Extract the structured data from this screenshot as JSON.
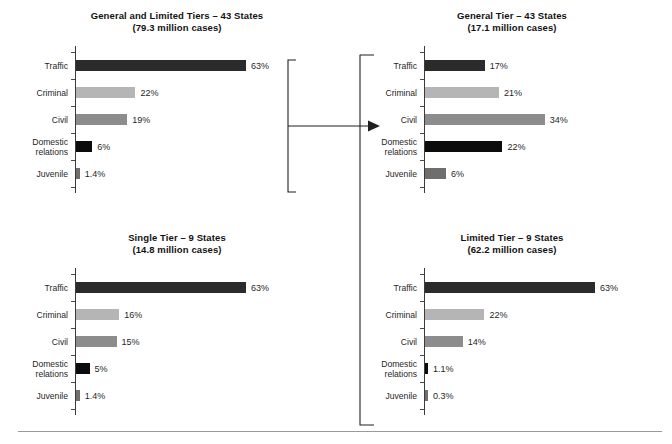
{
  "figure": {
    "background": "#ffffff",
    "rule_color": "#9a9a9a"
  },
  "palette": {
    "traffic": "#2b2b2b",
    "criminal": "#b5b5b5",
    "civil": "#8c8c8c",
    "domestic": "#0c0c0c",
    "juvenile": "#6e6e6e"
  },
  "categories": [
    "Traffic",
    "Criminal",
    "Civil",
    "Domestic\nrelations",
    "Juvenile"
  ],
  "connector": {
    "arrow_name": "flow-arrow-right",
    "left_bracket_name": "left-chart-close-bracket",
    "right_bracket_name": "right-charts-open-bracket"
  },
  "chart_data": [
    {
      "id": "general-and-limited",
      "type": "bar",
      "orientation": "horizontal",
      "title": "General and Limited Tiers – 43 States",
      "subtitle": "(79.3 million cases)",
      "categories": [
        "Traffic",
        "Criminal",
        "Civil",
        "Domestic relations",
        "Juvenile"
      ],
      "values": [
        63,
        22,
        19,
        6,
        1.4
      ],
      "labels": [
        "63%",
        "22%",
        "19%",
        "6%",
        "1.4%"
      ],
      "xlabel": "",
      "ylabel": "",
      "xlim": [
        0,
        70
      ],
      "grid": false,
      "legend": "none"
    },
    {
      "id": "general-tier",
      "type": "bar",
      "orientation": "horizontal",
      "title": "General Tier – 43 States",
      "subtitle": "(17.1 million cases)",
      "categories": [
        "Traffic",
        "Criminal",
        "Civil",
        "Domestic relations",
        "Juvenile"
      ],
      "values": [
        17,
        21,
        34,
        22,
        6
      ],
      "labels": [
        "17%",
        "21%",
        "34%",
        "22%",
        "6%"
      ],
      "xlabel": "",
      "ylabel": "",
      "xlim": [
        0,
        38
      ],
      "grid": false,
      "legend": "none"
    },
    {
      "id": "single-tier",
      "type": "bar",
      "orientation": "horizontal",
      "title": "Single Tier – 9 States",
      "subtitle": "(14.8 million cases)",
      "categories": [
        "Traffic",
        "Criminal",
        "Civil",
        "Domestic relations",
        "Juvenile"
      ],
      "values": [
        63,
        16,
        15,
        5,
        1.4
      ],
      "labels": [
        "63%",
        "16%",
        "15%",
        "5%",
        "1.4%"
      ],
      "xlabel": "",
      "ylabel": "",
      "xlim": [
        0,
        70
      ],
      "grid": false,
      "legend": "none"
    },
    {
      "id": "limited-tier",
      "type": "bar",
      "orientation": "horizontal",
      "title": "Limited Tier – 9 States",
      "subtitle": "(62.2 million cases)",
      "categories": [
        "Traffic",
        "Criminal",
        "Civil",
        "Domestic relations",
        "Juvenile"
      ],
      "values": [
        63,
        22,
        14,
        1.1,
        0.3
      ],
      "labels": [
        "63%",
        "22%",
        "14%",
        "1.1%",
        "0.3%"
      ],
      "xlabel": "",
      "ylabel": "",
      "xlim": [
        0,
        70
      ],
      "grid": false,
      "legend": "none"
    }
  ]
}
